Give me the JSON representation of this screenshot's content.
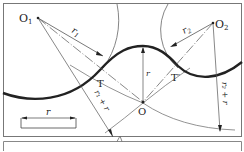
{
  "diagram": {
    "type": "geometry",
    "points": {
      "O1": {
        "label": "O",
        "sub": "1"
      },
      "O2": {
        "label": "O",
        "sub": "2"
      },
      "O": {
        "label": "O"
      },
      "T": {
        "label": "T"
      },
      "T_prime": {
        "label": "T′"
      }
    },
    "dimensions": {
      "r1": {
        "label": "r",
        "sub": "1"
      },
      "r2": {
        "label": "r",
        "sub": "2"
      },
      "r": {
        "label": "r"
      },
      "r1_plus_r": {
        "label": "r₁ + r"
      },
      "r2_plus_r": {
        "label": "r₂ + r"
      },
      "scale_r": {
        "label": "r"
      }
    },
    "colors": {
      "line": "#222222",
      "thin": "#555555",
      "frame": "#666666"
    }
  }
}
